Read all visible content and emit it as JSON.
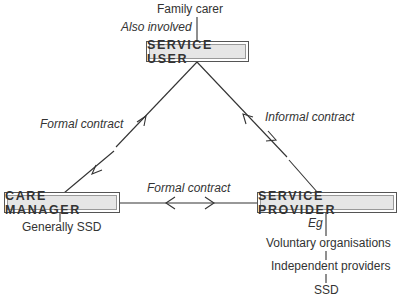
{
  "nodes": {
    "service_user": "SERVICE USER",
    "care_manager": "CARE MANAGER",
    "service_provider": "SERVICE PROVIDER"
  },
  "annotations": {
    "family_carer": "Family carer",
    "also_involved": "Also involved",
    "generally_ssd": "Generally SSD",
    "eg": "Eg"
  },
  "edges": {
    "user_manager": "Formal contract",
    "user_provider": "Informal contract",
    "manager_provider": "Formal contract"
  },
  "provider_examples": [
    "Voluntary organisations",
    "Independent providers",
    "SSD"
  ],
  "colors": {
    "line": "#333333",
    "box_fill": "#e6e6e6",
    "text": "#333333"
  }
}
